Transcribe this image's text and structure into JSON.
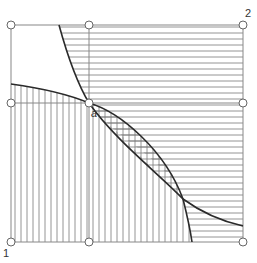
{
  "diagram": {
    "type": "region-hatching-diagram",
    "frame": {
      "x1": 11,
      "y1": 25,
      "x2": 243,
      "y2": 242
    },
    "divider_vertical_x": 89,
    "divider_horizontal_y": 103,
    "labels": {
      "corner_bottom_left": "1",
      "corner_top_right": "2",
      "intersection_point": "a"
    },
    "nodes": [
      {
        "id": "top-left",
        "x": 11,
        "y": 25
      },
      {
        "id": "top-middle",
        "x": 89,
        "y": 25
      },
      {
        "id": "top-right",
        "x": 243,
        "y": 25
      },
      {
        "id": "middle-left",
        "x": 11,
        "y": 103
      },
      {
        "id": "center-a",
        "x": 89,
        "y": 103
      },
      {
        "id": "middle-right",
        "x": 243,
        "y": 103
      },
      {
        "id": "bottom-left",
        "x": 11,
        "y": 242
      },
      {
        "id": "bottom-middle",
        "x": 89,
        "y": 242
      },
      {
        "id": "bottom-right",
        "x": 243,
        "y": 242
      }
    ],
    "curves": [
      {
        "name": "steep-curve",
        "path": "M59,25 C70,65 80,88 89,103 C115,140 170,160 183,199 C187,215 190,228 192,242"
      },
      {
        "name": "flat-curve",
        "path": "M11,84 C40,88 70,95 89,103 C120,130 150,170 183,199 C205,215 225,222 243,226"
      }
    ],
    "hatching": {
      "horizontal_spacing": 6,
      "vertical_spacing": 6,
      "line_color": "#777777",
      "stroke_color": "#2a2a2a",
      "frame_color": "#888888"
    }
  }
}
